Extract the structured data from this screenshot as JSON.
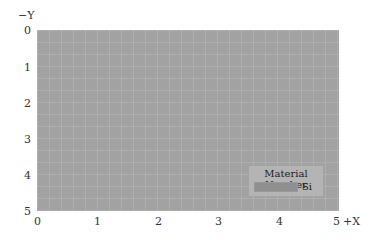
{
  "axes": {
    "y_label": "−Y",
    "x_label": "+X",
    "y_ticks": [
      "0",
      "1",
      "2",
      "3",
      "4",
      "5"
    ],
    "x_ticks": [
      "0",
      "1",
      "2",
      "3",
      "4",
      "5"
    ]
  },
  "legend": {
    "title": "Material Number",
    "items": [
      {
        "label": "Si",
        "color": "#8f8f8f"
      }
    ]
  },
  "colors": {
    "fill": "#a2a2a2"
  }
}
